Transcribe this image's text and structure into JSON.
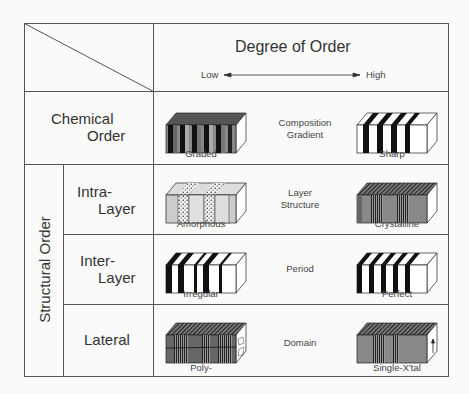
{
  "header": {
    "title": "Degree of Order",
    "axis_low": "Low",
    "axis_high": "High"
  },
  "rows": [
    {
      "category_line1": "Chemical",
      "category_line2": "Order",
      "property_line1": "Composition",
      "property_line2": "Gradient",
      "low_label": "Graded",
      "high_label": "Sharp"
    },
    {
      "category_line1": "Intra-",
      "category_line2": "Layer",
      "property_line1": "Layer",
      "property_line2": "Structure",
      "low_label": "Amorphous",
      "high_label": "Crystalline"
    },
    {
      "category_line1": "Inter-",
      "category_line2": "Layer",
      "property_line1": "Period",
      "property_line2": "",
      "low_label": "Irregular",
      "high_label": "Perfect"
    },
    {
      "category_line1": "Lateral",
      "category_line2": "",
      "property_line1": "Domain",
      "property_line2": "",
      "low_label": "Poly-",
      "high_label": "Single-X'tal"
    }
  ],
  "group_label": "Structural Order",
  "colors": {
    "line": "#555555",
    "text": "#333333",
    "background": "#fafafa"
  }
}
